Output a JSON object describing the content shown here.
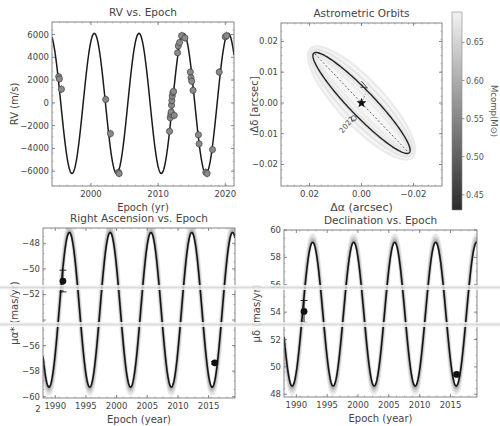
{
  "figure": {
    "background": "#ffffff",
    "artifact_bands_y": [
      287,
      324
    ]
  },
  "chart_data": [
    {
      "id": "rv",
      "type": "line",
      "title": "RV vs. Epoch",
      "xlabel": "Epoch (yr)",
      "ylabel": "RV (m/s)",
      "xlim": [
        1994.2,
        2021.3
      ],
      "ylim": [
        -7300,
        7100
      ],
      "xticks": [
        2000,
        2010,
        2020
      ],
      "yticks": [
        -6000,
        -4000,
        -2000,
        0,
        2000,
        4000,
        6000
      ],
      "grid": false,
      "model": {
        "amplitude": 6150,
        "offset": -50,
        "period": 6.65,
        "peak_epoch": 2000.5
      },
      "series": [
        {
          "name": "RV data",
          "style": "gray circles",
          "color": "#8a8a8a",
          "x": [
            1995.2,
            1995.3,
            1995.6,
            2002.2,
            2002.9,
            2004.1,
            2004.2,
            2011.7,
            2011.8,
            2011.9,
            2011.95,
            2012.0,
            2012.05,
            2012.1,
            2012.2,
            2012.3,
            2012.4,
            2012.9,
            2013.0,
            2013.2,
            2013.5,
            2014.0,
            2014.8,
            2014.9,
            2015.0,
            2015.2,
            2016.0,
            2016.1,
            2017.1,
            2017.3,
            2018.1,
            2019.1,
            2020.0,
            2020.2
          ],
          "y": [
            2300,
            2100,
            1200,
            300,
            -2700,
            -6100,
            -6200,
            -2500,
            -1300,
            -1000,
            -800,
            -200,
            200,
            600,
            900,
            1000,
            -1100,
            4400,
            5000,
            5300,
            5900,
            5700,
            2700,
            2200,
            1900,
            1100,
            -2800,
            -3600,
            -6100,
            -6200,
            -4100,
            2700,
            5800,
            5900
          ]
        }
      ]
    },
    {
      "id": "astrometric",
      "type": "scatter",
      "title": "Astrometric Orbits",
      "xlabel": "Δα (arcsec)",
      "ylabel": "Δδ [arcsec]",
      "xlim": [
        0.031,
        -0.031
      ],
      "ylim": [
        -0.027,
        0.026
      ],
      "xticks": [
        0.02,
        0.0,
        -0.02
      ],
      "xticklabels": [
        "0.02",
        "0.00",
        "−0.02"
      ],
      "yticks": [
        -0.02,
        -0.01,
        0.0,
        0.01,
        0.02
      ],
      "yticklabels": [
        "−0.02",
        "−0.01",
        "0.00",
        "0.01",
        "0.02"
      ],
      "ellipse": {
        "cx": 0.0,
        "cy": 0.0,
        "semi_major": 0.0245,
        "semi_minor": 0.0042,
        "angle_deg": -41
      },
      "line_of_nodes": [
        [
          0.018,
          0.016
        ],
        [
          -0.018,
          -0.016
        ]
      ],
      "star_marker": [
        0.0,
        0.0
      ],
      "arrow_at": [
        -0.0015,
        0.0055
      ],
      "epoch_marker": {
        "label": "2022",
        "x": 0.003,
        "y": -0.005
      },
      "colorbar": {
        "label": "M_comp(M_⊙)",
        "range": [
          0.43,
          0.69
        ],
        "ticks": [
          0.45,
          0.5,
          0.55,
          0.6,
          0.65
        ],
        "ticklabels": [
          "0.45",
          "0.50",
          "0.55",
          "0.60",
          "0.65"
        ],
        "cmap": [
          "#2a2a2a",
          "#f2f2f2"
        ]
      }
    },
    {
      "id": "ra",
      "type": "line",
      "title": "Right Ascension vs. Epoch",
      "xlabel": "Epoch (year)",
      "ylabel": "μα* (mas/yr)",
      "xlim": [
        1988.0,
        2019.3
      ],
      "ylim": [
        -60.1,
        -46.8
      ],
      "xticks": [
        1990,
        1995,
        2000,
        2005,
        2010,
        2015
      ],
      "yticks": [
        -60,
        -58,
        -56,
        -54,
        -52,
        -50,
        -48
      ],
      "yticklabels": [
        "−60",
        "−58",
        "−56",
        "",
        "−52",
        "−50",
        "−48"
      ],
      "model": {
        "center": -53.2,
        "amplitude": 6.05,
        "period": 6.65,
        "peak_epoch": 1992.3
      },
      "series": [
        {
          "name": "Hipparcos",
          "x": [
            1991.25
          ],
          "y": [
            -50.95
          ],
          "yerr": [
            0.85
          ]
        },
        {
          "name": "Gaia",
          "x": [
            2016.0
          ],
          "y": [
            -57.35
          ],
          "yerr": [
            0.1
          ]
        }
      ],
      "stray_label": "2"
    },
    {
      "id": "dec",
      "type": "line",
      "title": "Declination vs. Epoch",
      "xlabel": "Epoch (year)",
      "ylabel": "μδ (mas/yr)",
      "xlim": [
        1988.0,
        2019.3
      ],
      "ylim": [
        47.8,
        60.0
      ],
      "xticks": [
        1990,
        1995,
        2000,
        2005,
        2010,
        2015
      ],
      "yticks": [
        48,
        50,
        52,
        54,
        56,
        58,
        60
      ],
      "model": {
        "center": 53.85,
        "amplitude": 5.25,
        "period": 6.65,
        "peak_epoch": 1992.65
      },
      "series": [
        {
          "name": "Hipparcos",
          "x": [
            1991.25
          ],
          "y": [
            54.05
          ],
          "yerr": [
            0.8
          ]
        },
        {
          "name": "Gaia",
          "x": [
            2016.0
          ],
          "y": [
            49.45
          ],
          "yerr": [
            0.1
          ]
        }
      ]
    }
  ]
}
